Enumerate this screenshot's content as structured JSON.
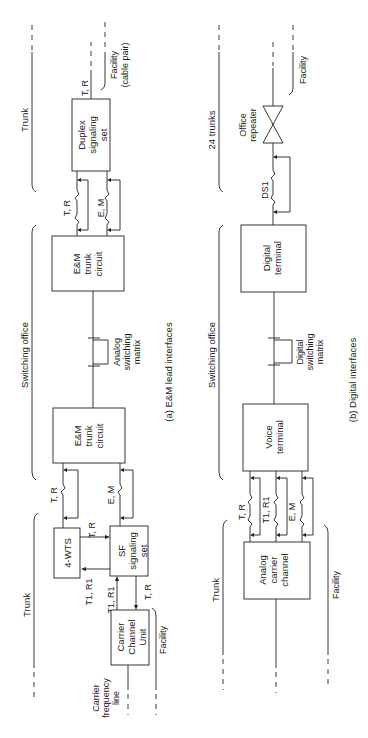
{
  "diagram_a": {
    "caption": "(a) E&M lead interfaces",
    "regions": {
      "trunk_top": "Trunk",
      "switching_office": "Switching office",
      "trunk_bottom": "Trunk"
    },
    "blocks": {
      "duplex": [
        "Duplex",
        "signaling",
        "set"
      ],
      "em_trunk_1": [
        "E&M",
        "trunk",
        "circuit"
      ],
      "em_trunk_2": [
        "E&M",
        "trunk",
        "circuit"
      ],
      "four_wts": "4-WTS",
      "sf_set": [
        "SF",
        "signaling",
        "set"
      ],
      "carrier_channel_unit": [
        "Carrier",
        "Channel",
        "Unit"
      ]
    },
    "labels": {
      "facility_cable_pair": [
        "Facility",
        "(cable pair)"
      ],
      "tr_duplex_out": "T, R",
      "tr_top_leads": "T, R",
      "em_top_leads": "E, M",
      "analog_matrix": [
        "Analog",
        "switching",
        "matrix"
      ],
      "tr_bottom_leads": "T, R",
      "em_bottom_leads": "E, M",
      "tr_4wts_sf": "T, R",
      "t1r1_sf_4wts": "T1, R1",
      "t1r1_ccu_sf": "T1, R1",
      "tr_sf_ccu": "T, R",
      "facility": "Facility",
      "carrier_frequency_line": [
        "Carrier",
        "frequency",
        "line"
      ]
    }
  },
  "diagram_b": {
    "caption": "(b) Digital interfaces",
    "regions": {
      "trunks_24": "24 trunks",
      "switching_office": "Switching office",
      "trunk": "Trunk"
    },
    "blocks": {
      "office_repeater": [
        "Office",
        "repeater"
      ],
      "digital_terminal": [
        "Digital",
        "terminal"
      ],
      "voice_terminal": [
        "Voice",
        "terminal"
      ],
      "analog_carrier_channel": [
        "Analog",
        "carrier",
        "channel"
      ]
    },
    "labels": {
      "facility_top": "Facility",
      "ds1": "DS1",
      "digital_matrix": [
        "Digital",
        "switching",
        "matrix"
      ],
      "tr_leads": "T, R",
      "t1r1_leads": "T1, R1",
      "em_leads": "E, M",
      "facility_bottom": "Facility"
    }
  }
}
